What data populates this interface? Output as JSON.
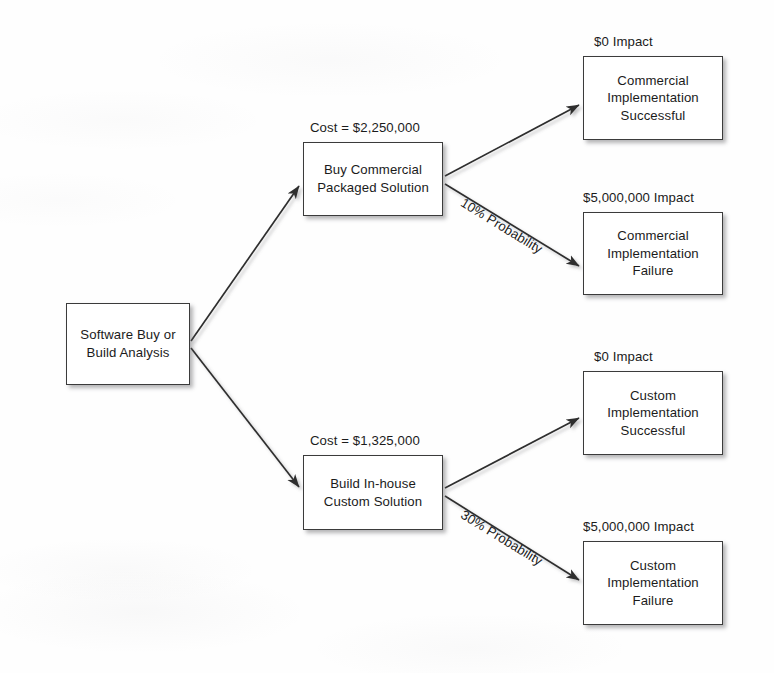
{
  "diagram": {
    "type": "decision-tree",
    "colors": {
      "background": "#fefefe",
      "box_fill": "#ffffff",
      "box_border": "#3b3b3b",
      "text": "#1b1b1b",
      "edge": "#2e2e2e",
      "shadow": "rgba(90,90,95,0.45)"
    },
    "nodes": {
      "root": {
        "label": "Software Buy or\nBuild Analysis",
        "x": 66,
        "y": 303,
        "w": 124,
        "h": 82
      },
      "buy": {
        "label": "Buy Commercial\nPackaged Solution",
        "caption": "Cost = $2,250,000",
        "x": 303,
        "y": 142,
        "w": 140,
        "h": 74
      },
      "build": {
        "label": "Build In-house\nCustom Solution",
        "caption": "Cost = $1,325,000",
        "x": 303,
        "y": 455,
        "w": 140,
        "h": 75
      },
      "commercial_success": {
        "label": "Commercial\nImplementation\nSuccessful",
        "caption": "$0 Impact",
        "x": 583,
        "y": 56,
        "w": 140,
        "h": 84
      },
      "commercial_failure": {
        "label": "Commercial\nImplementation\nFailure",
        "caption": "$5,000,000 Impact",
        "x": 583,
        "y": 212,
        "w": 140,
        "h": 83
      },
      "custom_success": {
        "label": "Custom\nImplementation\nSuccessful",
        "caption": "$0 Impact",
        "x": 583,
        "y": 371,
        "w": 140,
        "h": 84
      },
      "custom_failure": {
        "label": "Custom\nImplementation\nFailure",
        "caption": "$5,000,000 Impact",
        "x": 583,
        "y": 541,
        "w": 140,
        "h": 84
      }
    },
    "edge_labels": {
      "commercial_failure_probability": "10% Probability",
      "custom_failure_probability": "30% Probability"
    }
  }
}
